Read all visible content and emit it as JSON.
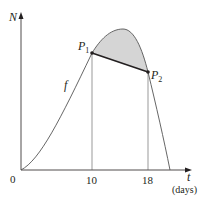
{
  "diagram": {
    "y_axis": {
      "label": "N"
    },
    "x_axis": {
      "label": "t",
      "unit_label": "(days)",
      "origin_label": "0",
      "ticks": [
        "10",
        "18"
      ]
    },
    "curve": {
      "label": "f"
    },
    "points": [
      {
        "name": "P",
        "subscript": "1",
        "t": 10
      },
      {
        "name": "P",
        "subscript": "2",
        "t": 18
      }
    ],
    "colors": {
      "line": "#231f20",
      "shade": "#d5d5d5",
      "thin": "#555555"
    }
  }
}
